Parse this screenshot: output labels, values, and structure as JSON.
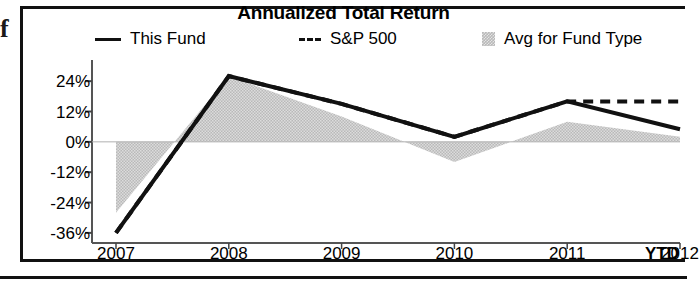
{
  "artifact": {
    "glyph": "f"
  },
  "chart_data": {
    "type": "area",
    "title": "Annualized Total Return",
    "xlabel": "",
    "ylabel": "",
    "x": [
      "2007",
      "2008",
      "2009",
      "2010",
      "2011",
      "2012"
    ],
    "categories": [
      "2007",
      "2008",
      "2009",
      "2010",
      "2011",
      "2012"
    ],
    "x_suffix_label": "YTD",
    "ylim": [
      -40,
      30
    ],
    "yticks": [
      24,
      12,
      0,
      -12,
      -24,
      -36
    ],
    "ytick_labels": [
      "24%",
      "12%",
      "0%",
      "-12%",
      "-24%",
      "-36%"
    ],
    "grid": false,
    "legend_position": "top",
    "zero_line": 0,
    "series": [
      {
        "name": "This Fund",
        "style": "solid-line",
        "color": "#111111",
        "values": [
          -36,
          26,
          15,
          2,
          16,
          5
        ]
      },
      {
        "name": "S&P 500",
        "style": "dashed-line",
        "color": "#111111",
        "values": [
          -36,
          26,
          15,
          2,
          16,
          16
        ]
      },
      {
        "name": "Avg for Fund Type",
        "style": "filled-area",
        "color": "#b9b9b9",
        "values": [
          -28,
          26,
          10,
          -8,
          8,
          2
        ]
      }
    ]
  },
  "legend": {
    "items": [
      {
        "label": "This Fund",
        "swatch": "solid-line-swatch"
      },
      {
        "label": "S&P 500",
        "swatch": "dashed-line-swatch"
      },
      {
        "label": "Avg for Fund Type",
        "swatch": "area-swatch"
      }
    ]
  }
}
